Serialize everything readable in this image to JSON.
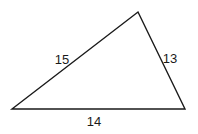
{
  "diagram": {
    "type": "triangle",
    "vertices": {
      "left": [
        12,
        109
      ],
      "top": [
        138,
        12
      ],
      "right": [
        185,
        109
      ]
    },
    "sides": {
      "left_side": {
        "label": "15",
        "pos": [
          62,
          64
        ]
      },
      "right_side": {
        "label": "13",
        "pos": [
          170,
          63
        ]
      },
      "base": {
        "label": "14",
        "pos": [
          94,
          126
        ]
      }
    },
    "stroke_color": "#1a1a1a",
    "background": "#ffffff"
  }
}
